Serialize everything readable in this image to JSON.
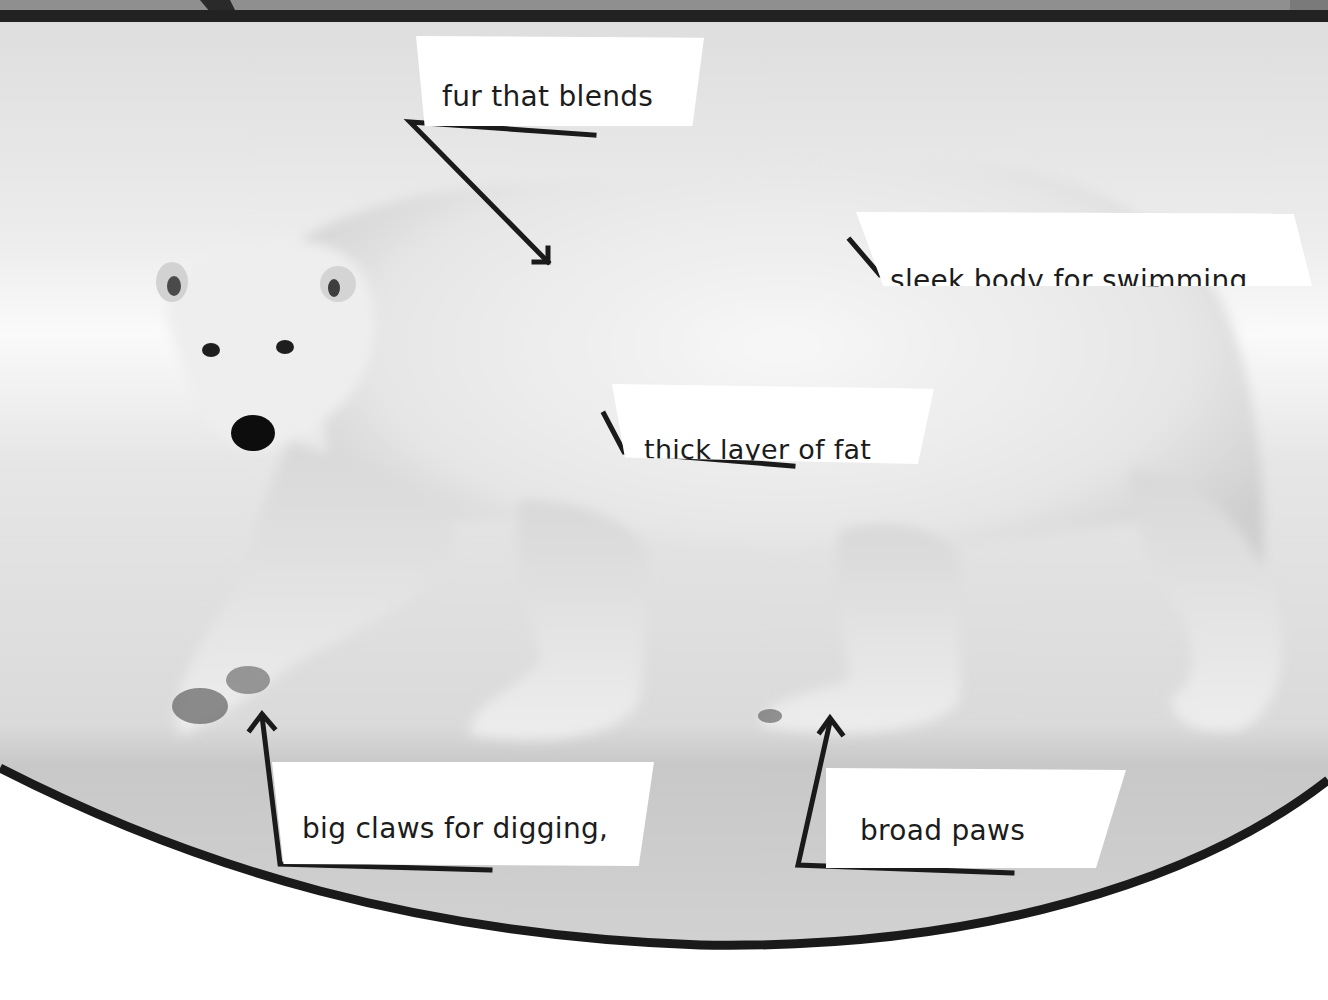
{
  "page": {
    "background_colors": {
      "snow_light": "#f4f4f4",
      "snow_mid": "#dcdcdc",
      "ground": "#c9c9c9",
      "top_band": "#2a2a2a",
      "top_strip": "#8a8a8a",
      "frame_line": "#1a1a1a",
      "page_white": "#ffffff"
    }
  },
  "labels": [
    {
      "id": "fur",
      "lines": [
        "fur that blends",
        "in with habitat"
      ]
    },
    {
      "id": "sleek",
      "lines": [
        "sleek body for swimming"
      ]
    },
    {
      "id": "fat",
      "lines": [
        "thick layer of fat"
      ]
    },
    {
      "id": "claws",
      "lines": [
        "big claws for digging,",
        "tearing, and gripping"
      ]
    },
    {
      "id": "paws",
      "lines": [
        "broad paws",
        "for swimming"
      ]
    }
  ]
}
